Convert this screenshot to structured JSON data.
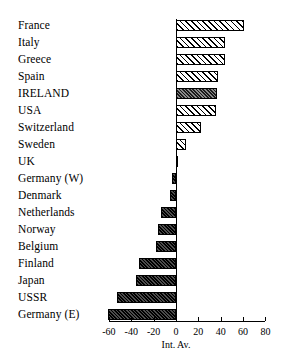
{
  "chart_data": {
    "type": "bar",
    "orientation": "horizontal",
    "title": "",
    "xlabel": "Int. Av.",
    "ylabel": "",
    "xlim": [
      -60,
      80
    ],
    "xticks": [
      -60,
      -40,
      -20,
      0,
      20,
      40,
      60,
      80
    ],
    "xtick_labels": [
      "-60",
      "-40",
      "-20",
      "0",
      "20",
      "40",
      "60",
      "80"
    ],
    "grid": false,
    "legend": null,
    "highlight_category": "IRELAND",
    "categories": [
      "France",
      "Italy",
      "Greece",
      "Spain",
      "IRELAND",
      "USA",
      "Switzerland",
      "Sweden",
      "UK",
      "Germany (W)",
      "Denmark",
      "Netherlands",
      "Norway",
      "Belgium",
      "Finland",
      "Japan",
      "USSR",
      "Germany (E)"
    ],
    "values": [
      61,
      44,
      44,
      38,
      37,
      36,
      22,
      9,
      1,
      -4,
      -5,
      -13,
      -16,
      -18,
      -33,
      -36,
      -53,
      -61
    ],
    "bars": [
      {
        "label": "France",
        "value": 61,
        "style": "pos"
      },
      {
        "label": "Italy",
        "value": 44,
        "style": "pos"
      },
      {
        "label": "Greece",
        "value": 44,
        "style": "pos"
      },
      {
        "label": "Spain",
        "value": 38,
        "style": "pos"
      },
      {
        "label": "IRELAND",
        "value": 37,
        "style": "hl"
      },
      {
        "label": "USA",
        "value": 36,
        "style": "pos"
      },
      {
        "label": "Switzerland",
        "value": 22,
        "style": "pos"
      },
      {
        "label": "Sweden",
        "value": 9,
        "style": "pos"
      },
      {
        "label": "UK",
        "value": 1,
        "style": "pos"
      },
      {
        "label": "Germany (W)",
        "value": -4,
        "style": "neg"
      },
      {
        "label": "Denmark",
        "value": -5,
        "style": "neg"
      },
      {
        "label": "Netherlands",
        "value": -13,
        "style": "neg"
      },
      {
        "label": "Norway",
        "value": -16,
        "style": "neg"
      },
      {
        "label": "Belgium",
        "value": -18,
        "style": "neg"
      },
      {
        "label": "Finland",
        "value": -33,
        "style": "neg"
      },
      {
        "label": "Japan",
        "value": -36,
        "style": "neg"
      },
      {
        "label": "USSR",
        "value": -53,
        "style": "neg"
      },
      {
        "label": "Germany (E)",
        "value": -61,
        "style": "neg"
      }
    ]
  },
  "colors": {
    "axis": "#000000",
    "bar_outline": "#000000",
    "positive_fill": "#ffffff",
    "negative_fill": "#2b2b2b",
    "highlight_fill": "#5a5a5a",
    "background": "#ffffff"
  }
}
